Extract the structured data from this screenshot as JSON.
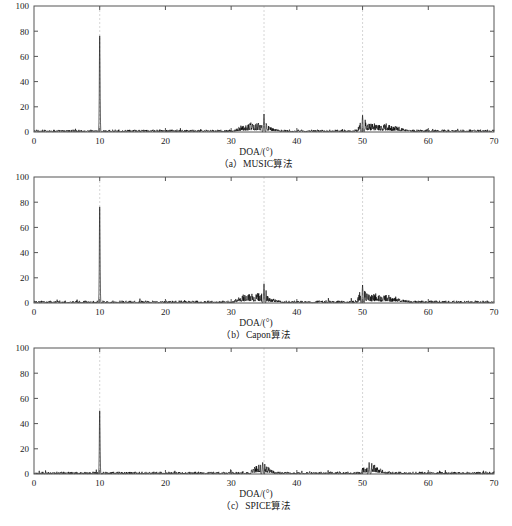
{
  "page": {
    "top_note": "",
    "background": "#ffffff",
    "axis_color": "#555555",
    "trace_color": "#000000",
    "grid_color": "#cccccc"
  },
  "figure": {
    "panel_count": 3,
    "xlabel": "DOA/(°)",
    "x_ticks": [
      0,
      10,
      20,
      30,
      40,
      50,
      60,
      70
    ],
    "y_ticks": [
      0,
      20,
      40,
      60,
      80,
      100
    ],
    "xlim": [
      0,
      70
    ],
    "ylim": [
      0,
      100
    ],
    "grid_lines_x": [
      10,
      35,
      50
    ],
    "panels": [
      {
        "id": "panel-a",
        "caption_index": "（a）",
        "caption_name": "MUSIC",
        "caption_suffix": "算法",
        "caption_full": "（a）MUSIC算法"
      },
      {
        "id": "panel-b",
        "caption_index": "（b）",
        "caption_name": "Capon",
        "caption_suffix": "算法",
        "caption_full": "（b）Capon算法"
      },
      {
        "id": "panel-c",
        "caption_index": "（c）",
        "caption_name": "SPICE",
        "caption_suffix": "算法",
        "caption_full": "（c）SPICE算法"
      }
    ]
  },
  "chart_data": [
    {
      "type": "line",
      "title": "（a）MUSIC算法",
      "xlabel": "DOA/(°)",
      "ylabel": "",
      "xlim": [
        0,
        70
      ],
      "ylim": [
        0,
        100
      ],
      "xticks": [
        0,
        10,
        20,
        30,
        40,
        50,
        60,
        70
      ],
      "yticks": [
        0,
        20,
        40,
        60,
        80,
        100
      ],
      "grid": false,
      "vertical_guides": [
        10,
        35,
        50
      ],
      "legend": "none",
      "peaks": [
        {
          "x": 10.0,
          "y": 76
        },
        {
          "x": 35.0,
          "y": 14
        },
        {
          "x": 50.0,
          "y": 13
        }
      ],
      "noise_clusters": [
        {
          "from": 30.5,
          "to": 37.5,
          "peak": 14,
          "typical": 4
        },
        {
          "from": 49.2,
          "to": 57.0,
          "peak": 13,
          "typical": 4
        }
      ],
      "baseline": 0.3,
      "series": [
        {
          "name": "spectrum",
          "x": [
            0,
            5,
            10,
            15,
            20,
            25,
            27.5,
            30.5,
            31.5,
            32.2,
            33,
            33.6,
            34.2,
            34.6,
            35,
            35.4,
            36,
            36.8,
            37.5,
            40,
            42,
            45,
            47,
            49.2,
            50,
            50.6,
            51.3,
            52,
            52.8,
            53.6,
            54.4,
            55.2,
            56,
            57,
            60,
            65,
            70
          ],
          "values": [
            0.2,
            0.3,
            76,
            0.4,
            0.4,
            0.5,
            1.6,
            1.2,
            4.2,
            5.4,
            6.5,
            4.8,
            7.2,
            5.0,
            14,
            4.6,
            3.2,
            1.9,
            1.3,
            1.1,
            0.6,
            0.5,
            0.5,
            2.0,
            13,
            6.4,
            5.2,
            6.0,
            4.4,
            5.6,
            3.6,
            4.2,
            2.4,
            1.2,
            0.5,
            0.4,
            0.3
          ]
        }
      ]
    },
    {
      "type": "line",
      "title": "（b）Capon算法",
      "xlabel": "DOA/(°)",
      "ylabel": "",
      "xlim": [
        0,
        70
      ],
      "ylim": [
        0,
        100
      ],
      "xticks": [
        0,
        10,
        20,
        30,
        40,
        50,
        60,
        70
      ],
      "yticks": [
        0,
        20,
        40,
        60,
        80,
        100
      ],
      "grid": false,
      "vertical_guides": [
        10,
        35,
        50
      ],
      "legend": "none",
      "peaks": [
        {
          "x": 10.0,
          "y": 76
        },
        {
          "x": 35.0,
          "y": 15
        },
        {
          "x": 50.0,
          "y": 14
        }
      ],
      "noise_clusters": [
        {
          "from": 30.5,
          "to": 37.5,
          "peak": 15,
          "typical": 4
        },
        {
          "from": 49.2,
          "to": 57.0,
          "peak": 14,
          "typical": 4
        }
      ],
      "baseline": 0.3,
      "series": [
        {
          "name": "spectrum",
          "x": [
            0,
            5,
            10,
            15,
            20,
            25,
            27.5,
            30.4,
            31.4,
            32.1,
            32.9,
            33.5,
            34.1,
            34.6,
            35,
            35.5,
            36.1,
            36.9,
            37.6,
            40,
            42,
            45,
            47,
            49.2,
            50,
            50.6,
            51.4,
            52.1,
            52.9,
            53.7,
            54.5,
            55.3,
            56.1,
            57,
            60,
            65,
            70
          ],
          "values": [
            0.2,
            0.3,
            76,
            0.4,
            0.4,
            0.5,
            2.0,
            1.4,
            4.6,
            6.2,
            7.0,
            5.2,
            7.8,
            5.4,
            15,
            4.8,
            3.4,
            2.0,
            1.4,
            1.2,
            0.6,
            0.5,
            0.5,
            2.2,
            14,
            6.8,
            5.6,
            6.4,
            4.8,
            6.0,
            3.8,
            4.4,
            2.6,
            1.3,
            0.5,
            0.4,
            0.3
          ]
        }
      ]
    },
    {
      "type": "line",
      "title": "（c）SPICE算法",
      "xlabel": "DOA/(°)",
      "ylabel": "",
      "xlim": [
        0,
        70
      ],
      "ylim": [
        0,
        100
      ],
      "xticks": [
        0,
        10,
        20,
        30,
        40,
        50,
        60,
        70
      ],
      "yticks": [
        0,
        20,
        40,
        60,
        80,
        100
      ],
      "grid": false,
      "vertical_guides": [
        10,
        35,
        50
      ],
      "legend": "none",
      "peaks": [
        {
          "x": 10.0,
          "y": 50
        },
        {
          "x": 34.8,
          "y": 9
        },
        {
          "x": 51.0,
          "y": 9
        }
      ],
      "noise_clusters": [
        {
          "from": 33.0,
          "to": 36.5,
          "peak": 9,
          "typical": 3
        },
        {
          "from": 49.8,
          "to": 53.5,
          "peak": 9,
          "typical": 3
        }
      ],
      "baseline": 0.2,
      "series": [
        {
          "name": "spectrum",
          "x": [
            0,
            5,
            10,
            15,
            20,
            25,
            30,
            32.5,
            33.2,
            33.8,
            34.3,
            34.8,
            35.3,
            35.8,
            36.4,
            37.2,
            40,
            45,
            48,
            49.8,
            50.4,
            51,
            51.6,
            52.2,
            52.8,
            53.5,
            54.5,
            56,
            60,
            65,
            70
          ],
          "values": [
            0.2,
            0.2,
            50,
            0.3,
            0.3,
            0.3,
            0.4,
            1.0,
            3.6,
            5.4,
            6.6,
            9,
            6.0,
            4.2,
            2.4,
            1.0,
            0.4,
            0.3,
            0.4,
            2.6,
            6.2,
            9,
            7.0,
            5.4,
            3.6,
            1.8,
            0.6,
            0.4,
            0.3,
            0.3,
            0.2
          ]
        }
      ]
    }
  ]
}
